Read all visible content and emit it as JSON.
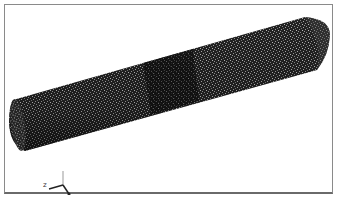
{
  "figure": {
    "colors": {
      "mesh_dark": "#1a1a1a",
      "mesh_light": "#6e6e6e",
      "background": "#ffffff",
      "frame": "#8a8a8a",
      "refined_region": "#0d0d0d"
    }
  },
  "triad": {
    "z_label": "z",
    "y_label": "y",
    "x_label": "x"
  }
}
